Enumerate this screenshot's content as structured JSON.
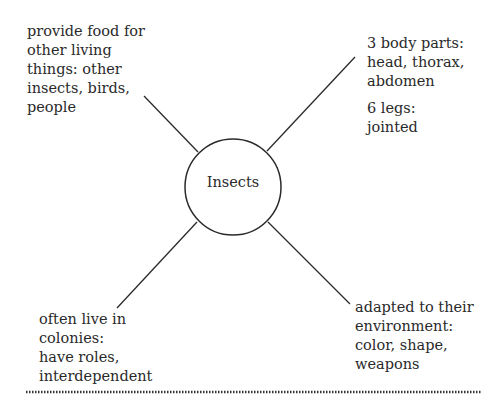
{
  "center": {
    "label": "Insects"
  },
  "nodes": {
    "top_left": {
      "lines": [
        "provide food for",
        "other living",
        "things: other",
        "insects, birds,",
        "people"
      ]
    },
    "top_right": {
      "group1": [
        "3 body parts:",
        "head, thorax,",
        "abdomen"
      ],
      "group2": [
        "6 legs:",
        "jointed"
      ]
    },
    "bottom_left": {
      "lines": [
        "often live in",
        "colonies:",
        "have roles,",
        "interdependent"
      ]
    },
    "bottom_right": {
      "lines": [
        "adapted to their",
        "environment:",
        "color, shape,",
        "weapons"
      ]
    }
  },
  "colors": {
    "line": "#2a2a2a",
    "divider": "#333333"
  }
}
